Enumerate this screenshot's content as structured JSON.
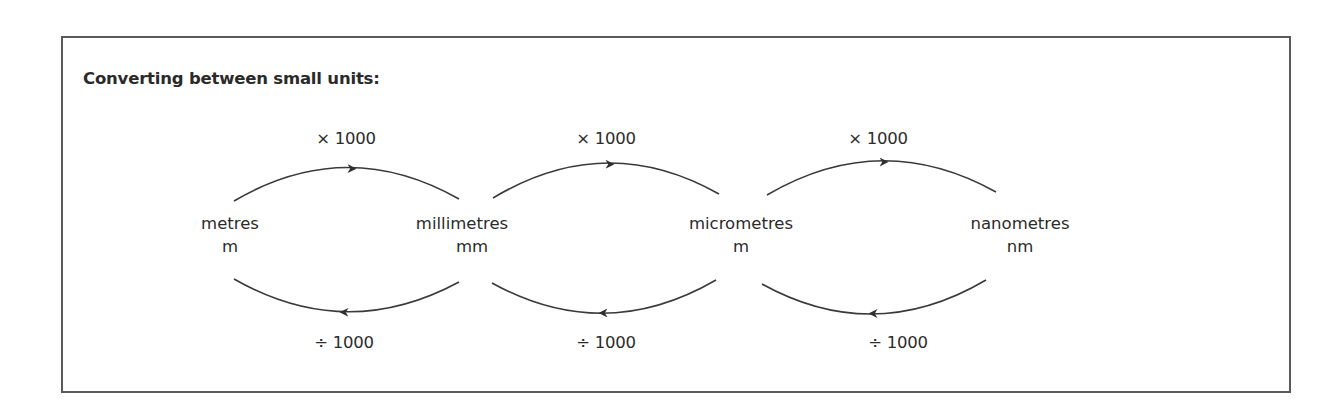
{
  "diagram": {
    "title": "Converting between small units:",
    "units": [
      {
        "name": "metres",
        "symbol": "m"
      },
      {
        "name": "millimetres",
        "symbol": "mm"
      },
      {
        "name": "micrometres",
        "symbol": "m"
      },
      {
        "name": "nanometres",
        "symbol": "nm"
      }
    ],
    "conversions": [
      {
        "from": "metres",
        "to": "millimetres",
        "forward": "× 1000",
        "backward": "÷ 1000"
      },
      {
        "from": "millimetres",
        "to": "micrometres",
        "forward": "× 1000",
        "backward": "÷ 1000"
      },
      {
        "from": "micrometres",
        "to": "nanometres",
        "forward": "× 1000",
        "backward": "÷ 1000"
      }
    ],
    "colors": {
      "line": "#3a3a3a",
      "border": "#5a5a5a",
      "text": "#2b2b2b"
    }
  }
}
